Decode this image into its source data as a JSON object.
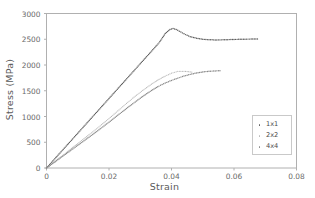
{
  "chart_data": {
    "type": "scatter",
    "title": "",
    "xlabel": "Strain",
    "ylabel": "Stress (MPa)",
    "xlim": [
      0,
      0.08
    ],
    "ylim": [
      0,
      3000
    ],
    "xticks": [
      "0",
      "0.02",
      "0.04",
      "0.06",
      "0.08"
    ],
    "xtick_values": [
      0,
      0.02,
      0.04,
      0.06,
      0.08
    ],
    "yticks": [
      "0",
      "500",
      "1000",
      "1500",
      "2000",
      "2500",
      "3000"
    ],
    "ytick_values": [
      0,
      500,
      1000,
      1500,
      2000,
      2500,
      3000
    ],
    "grid": false,
    "legend_position": "lower-right",
    "marker_style": "dotted",
    "series": [
      {
        "name": "1x1",
        "color": "#5e5e5e",
        "x": [
          0,
          0.002,
          0.004,
          0.006,
          0.008,
          0.01,
          0.012,
          0.014,
          0.016,
          0.018,
          0.02,
          0.022,
          0.024,
          0.026,
          0.028,
          0.03,
          0.032,
          0.034,
          0.036,
          0.038,
          0.0395,
          0.0405,
          0.0415,
          0.043,
          0.0445,
          0.046,
          0.048,
          0.05,
          0.052,
          0.054,
          0.056,
          0.058,
          0.06,
          0.062,
          0.064,
          0.066,
          0.0675
        ],
        "y": [
          0,
          135,
          270,
          405,
          540,
          675,
          810,
          945,
          1080,
          1215,
          1350,
          1485,
          1620,
          1755,
          1890,
          2025,
          2160,
          2295,
          2430,
          2610,
          2690,
          2710,
          2690,
          2640,
          2590,
          2550,
          2520,
          2500,
          2490,
          2487,
          2488,
          2492,
          2496,
          2500,
          2502,
          2504,
          2505
        ]
      },
      {
        "name": "2x2",
        "color": "#b8b8b8",
        "x": [
          0,
          0.002,
          0.004,
          0.006,
          0.008,
          0.01,
          0.012,
          0.014,
          0.016,
          0.018,
          0.02,
          0.022,
          0.024,
          0.026,
          0.028,
          0.03,
          0.032,
          0.034,
          0.036,
          0.038,
          0.04,
          0.042,
          0.044,
          0.0455,
          0.0465
        ],
        "y": [
          0,
          95,
          190,
          285,
          380,
          475,
          570,
          665,
          760,
          860,
          960,
          1065,
          1170,
          1275,
          1375,
          1470,
          1560,
          1645,
          1720,
          1785,
          1840,
          1878,
          1878,
          1870,
          1862
        ]
      },
      {
        "name": "4x4",
        "color": "#8a8a8a",
        "x": [
          0,
          0.002,
          0.004,
          0.006,
          0.008,
          0.01,
          0.012,
          0.014,
          0.016,
          0.018,
          0.02,
          0.022,
          0.024,
          0.026,
          0.028,
          0.03,
          0.032,
          0.034,
          0.036,
          0.038,
          0.04,
          0.042,
          0.044,
          0.046,
          0.048,
          0.05,
          0.052,
          0.054,
          0.0555
        ],
        "y": [
          0,
          88,
          176,
          264,
          352,
          440,
          528,
          616,
          706,
          798,
          890,
          985,
          1080,
          1175,
          1265,
          1355,
          1440,
          1520,
          1590,
          1650,
          1700,
          1745,
          1785,
          1818,
          1845,
          1865,
          1878,
          1885,
          1888
        ]
      }
    ]
  },
  "legend": {
    "entries": [
      {
        "label": "1x1",
        "color": "#5e5e5e"
      },
      {
        "label": "2x2",
        "color": "#b8b8b8"
      },
      {
        "label": "4x4",
        "color": "#8a8a8a"
      }
    ]
  },
  "axes": {
    "x_title": "Strain",
    "y_title": "Stress (MPa)"
  }
}
